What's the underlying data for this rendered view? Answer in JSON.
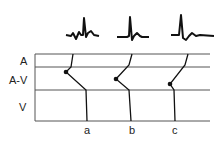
{
  "diagram": {
    "type": "ladder-diagram",
    "row_labels": [
      {
        "id": "A",
        "label": "A"
      },
      {
        "id": "AV",
        "label": "A-V"
      },
      {
        "id": "V",
        "label": "V"
      }
    ],
    "beats": [
      {
        "id": "a",
        "label": "a"
      },
      {
        "id": "b",
        "label": "b"
      },
      {
        "id": "c",
        "label": "c"
      }
    ],
    "colors": {
      "line": "#111111",
      "grid": "#555555",
      "text": "#222222"
    }
  }
}
